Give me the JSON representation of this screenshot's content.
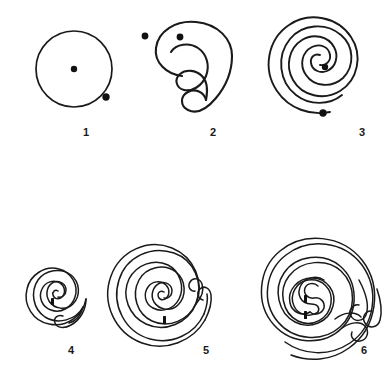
{
  "page": {
    "background_color": "#ffffff",
    "ink_color": "#1a1a1a",
    "width": 392,
    "height": 382,
    "figure_count": 6
  },
  "figures": [
    {
      "number": "1",
      "name": "circle-with-center-dot",
      "label": "1",
      "center_x": 74,
      "center_y": 69,
      "outer_radius": 38,
      "turns": 1,
      "stroke_width": 1.6,
      "dots": [
        {
          "name": "center-dot",
          "x": 74,
          "y": 69,
          "r": 3.2
        },
        {
          "name": "outer-dot",
          "x": 106,
          "y": 97,
          "r": 3.6
        }
      ],
      "ticks": []
    },
    {
      "number": "2",
      "name": "single-turn-spiral",
      "label": "2",
      "center_x": 177,
      "center_y": 68,
      "outer_radius": 44,
      "turns": 1.6,
      "stroke_width": 2.0,
      "dots": [
        {
          "name": "center-dot",
          "x": 180,
          "y": 65,
          "r": 3.4
        },
        {
          "name": "left-dot",
          "x": 145,
          "y": 64,
          "r": 3.4
        }
      ],
      "ticks": []
    },
    {
      "number": "3",
      "name": "double-turn-spiral",
      "label": "3",
      "center_x": 320,
      "center_y": 76,
      "outer_radius": 54,
      "turns": 2.6,
      "stroke_width": 1.8,
      "dots": [
        {
          "name": "center-dot",
          "x": 325,
          "y": 67,
          "r": 3.2
        },
        {
          "name": "lower-dot",
          "x": 323,
          "y": 113,
          "r": 3.6
        }
      ],
      "ticks": []
    },
    {
      "number": "4",
      "name": "small-labyrinth-spiral",
      "label": "4",
      "center_x": 57,
      "center_y": 289,
      "outer_radius": 36,
      "turns": 4.6,
      "stroke_width": 1.5,
      "dots": [],
      "ticks": [
        {
          "name": "center-tick",
          "x": 53,
          "y": 300,
          "w": 3,
          "h": 7
        }
      ]
    },
    {
      "number": "5",
      "name": "medium-labyrinth-spiral",
      "label": "5",
      "center_x": 165,
      "center_y": 294,
      "outer_radius": 62,
      "turns": 6.2,
      "stroke_width": 1.5,
      "dots": [],
      "ticks": [
        {
          "name": "center-tick",
          "x": 163,
          "y": 322,
          "w": 3,
          "h": 8
        }
      ]
    },
    {
      "number": "6",
      "name": "large-labyrinth-spiral",
      "label": "6",
      "center_x": 312,
      "center_y": 293,
      "outer_radius": 72,
      "turns": 7.0,
      "stroke_width": 1.5,
      "dots": [],
      "ticks": [
        {
          "name": "center-tick-upper",
          "x": 304,
          "y": 311,
          "w": 3,
          "h": 8
        },
        {
          "name": "center-tick-lower",
          "x": 304,
          "y": 327,
          "w": 3,
          "h": 8
        }
      ]
    }
  ],
  "labels": {
    "fig1": "1",
    "fig2": "2",
    "fig3": "3",
    "fig4": "4",
    "fig5": "5",
    "fig6": "6"
  }
}
